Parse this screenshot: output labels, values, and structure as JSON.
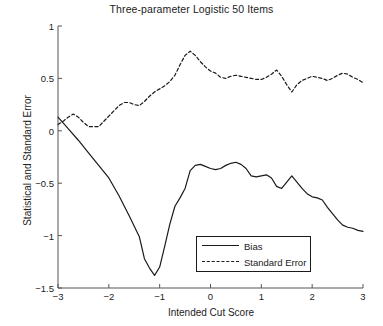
{
  "chart_data": {
    "type": "line",
    "title": "Three-parameter Logistic 50 Items",
    "xlabel": "Intended Cut Score",
    "ylabel": "Statistical and Standard Error",
    "xlim": [
      -3,
      3
    ],
    "ylim": [
      -1.5,
      1
    ],
    "xticks": [
      -3,
      -2,
      -1,
      0,
      1,
      2,
      3
    ],
    "xtick_labels": [
      "−3",
      "−2",
      "−1",
      "0",
      "1",
      "2",
      "3"
    ],
    "yticks": [
      1,
      0.5,
      0,
      -0.5,
      -1,
      -1.5
    ],
    "ytick_labels": [
      "1",
      "0.5",
      "0",
      "−0.5",
      "−1",
      "−1.5"
    ],
    "grid": false,
    "legend_position": "lower center",
    "series": [
      {
        "name": "Bias",
        "style": "solid",
        "color": "#1a1a1a",
        "x": [
          -3.0,
          -2.8,
          -2.6,
          -2.4,
          -2.2,
          -2.0,
          -1.8,
          -1.6,
          -1.4,
          -1.3,
          -1.2,
          -1.1,
          -1.0,
          -0.9,
          -0.8,
          -0.7,
          -0.6,
          -0.5,
          -0.4,
          -0.3,
          -0.2,
          -0.1,
          0.0,
          0.1,
          0.2,
          0.3,
          0.4,
          0.5,
          0.6,
          0.7,
          0.8,
          0.9,
          1.0,
          1.1,
          1.2,
          1.3,
          1.4,
          1.5,
          1.6,
          1.7,
          1.8,
          1.9,
          2.0,
          2.1,
          2.2,
          2.3,
          2.4,
          2.5,
          2.6,
          2.7,
          2.8,
          2.9,
          3.0
        ],
        "y": [
          0.13,
          0.02,
          -0.09,
          -0.21,
          -0.33,
          -0.45,
          -0.62,
          -0.81,
          -1.01,
          -1.22,
          -1.31,
          -1.38,
          -1.3,
          -1.1,
          -0.89,
          -0.72,
          -0.64,
          -0.55,
          -0.38,
          -0.33,
          -0.32,
          -0.34,
          -0.36,
          -0.37,
          -0.36,
          -0.33,
          -0.31,
          -0.3,
          -0.32,
          -0.36,
          -0.43,
          -0.44,
          -0.43,
          -0.42,
          -0.45,
          -0.53,
          -0.55,
          -0.49,
          -0.43,
          -0.49,
          -0.55,
          -0.6,
          -0.63,
          -0.64,
          -0.66,
          -0.73,
          -0.79,
          -0.85,
          -0.9,
          -0.92,
          -0.93,
          -0.95,
          -0.96
        ]
      },
      {
        "name": "Standard Error",
        "style": "dashed",
        "color": "#1a1a1a",
        "x": [
          -3.0,
          -2.9,
          -2.8,
          -2.7,
          -2.6,
          -2.5,
          -2.4,
          -2.3,
          -2.2,
          -2.1,
          -2.0,
          -1.9,
          -1.8,
          -1.7,
          -1.6,
          -1.5,
          -1.4,
          -1.3,
          -1.2,
          -1.1,
          -1.0,
          -0.9,
          -0.8,
          -0.7,
          -0.6,
          -0.5,
          -0.4,
          -0.3,
          -0.2,
          -0.1,
          0.0,
          0.1,
          0.2,
          0.3,
          0.4,
          0.5,
          0.6,
          0.7,
          0.8,
          0.9,
          1.0,
          1.1,
          1.2,
          1.3,
          1.4,
          1.5,
          1.6,
          1.7,
          1.8,
          1.9,
          2.0,
          2.1,
          2.2,
          2.3,
          2.4,
          2.5,
          2.6,
          2.7,
          2.8,
          2.9,
          3.0
        ],
        "y": [
          0.06,
          0.09,
          0.13,
          0.16,
          0.13,
          0.08,
          0.04,
          0.04,
          0.04,
          0.09,
          0.14,
          0.19,
          0.24,
          0.27,
          0.27,
          0.25,
          0.24,
          0.28,
          0.33,
          0.37,
          0.4,
          0.43,
          0.47,
          0.53,
          0.63,
          0.72,
          0.76,
          0.72,
          0.66,
          0.61,
          0.57,
          0.55,
          0.51,
          0.5,
          0.52,
          0.53,
          0.52,
          0.51,
          0.5,
          0.49,
          0.49,
          0.51,
          0.54,
          0.58,
          0.52,
          0.44,
          0.37,
          0.44,
          0.48,
          0.5,
          0.52,
          0.51,
          0.5,
          0.48,
          0.5,
          0.53,
          0.55,
          0.54,
          0.51,
          0.49,
          0.46
        ]
      }
    ]
  },
  "legend": {
    "items": [
      {
        "label": "Bias",
        "style": "solid"
      },
      {
        "label": "Standard Error",
        "style": "dashed"
      }
    ]
  }
}
